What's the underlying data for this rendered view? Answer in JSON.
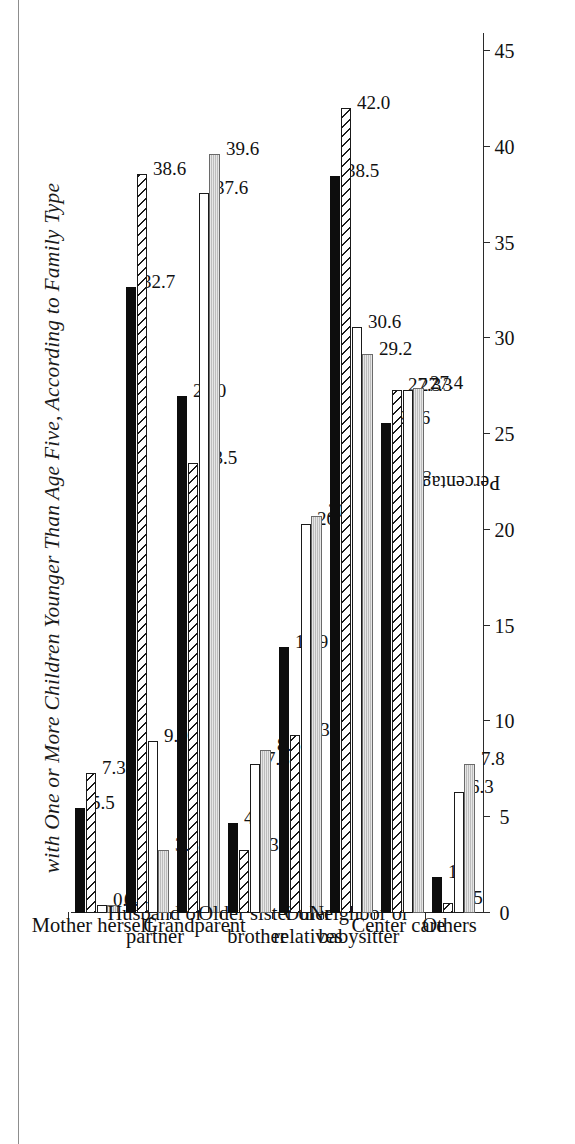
{
  "figure": {
    "title": "with One or More Children Younger Than Age Five, According to Family Type",
    "axis_label": "Percentage"
  },
  "chart_data": {
    "type": "bar",
    "orientation": "horizontal",
    "title": "with One or More Children Younger Than Age Five, According to Family Type",
    "xlabel": "Percentage",
    "ylabel": "",
    "ylim": [
      0,
      45
    ],
    "grid": false,
    "legend": null,
    "tick_labels": [
      "0",
      "5",
      "10",
      "15",
      "20",
      "25",
      "30",
      "35",
      "40",
      "45"
    ],
    "tick_values": [
      0,
      5,
      10,
      15,
      20,
      25,
      30,
      35,
      40,
      45
    ],
    "categories": [
      "Mother herself",
      "Husband or partner",
      "Grandparent",
      "Older sister or brother",
      "Other relatives",
      "Neighbor or babysitter",
      "Center care",
      "Others"
    ],
    "series": [
      {
        "name": "series-1",
        "fill": "black",
        "values": [
          5.5,
          32.7,
          27.0,
          4.7,
          13.9,
          38.5,
          25.6,
          1.9
        ]
      },
      {
        "name": "series-2",
        "fill": "hatch",
        "values": [
          7.3,
          38.6,
          23.5,
          3.3,
          9.3,
          42.0,
          27.3,
          0.5
        ]
      },
      {
        "name": "series-3",
        "fill": "white",
        "values": [
          0.4,
          9.0,
          37.6,
          7.8,
          20.3,
          30.6,
          27.3,
          6.3
        ]
      },
      {
        "name": "series-4",
        "fill": "gray",
        "values": [
          0.4,
          3.3,
          39.6,
          8.5,
          20.7,
          29.2,
          27.4,
          7.8
        ]
      }
    ],
    "value_labels": [
      [
        "5.5",
        "7.3",
        "0.4",
        "0.4"
      ],
      [
        "32.7",
        "38.6",
        "9.0",
        "3.3"
      ],
      [
        "27.0",
        "23.5",
        "37.6",
        "39.6"
      ],
      [
        "4.7",
        "3.3",
        "7.8",
        "8.5"
      ],
      [
        "13.9",
        "9.3",
        "20.3",
        "20.7"
      ],
      [
        "38.5",
        "42.0",
        "30.6",
        "29.2"
      ],
      [
        "25.6",
        "27.3",
        "27.3",
        "27.4"
      ],
      [
        "1.9",
        "0.5",
        "6.3",
        "7.8"
      ]
    ],
    "colors": {
      "black": "#0d0d0d",
      "hatch": "#ffffff",
      "white": "#ffffff",
      "gray": "#c9c9c9",
      "axis": "#2b2b2b"
    }
  }
}
